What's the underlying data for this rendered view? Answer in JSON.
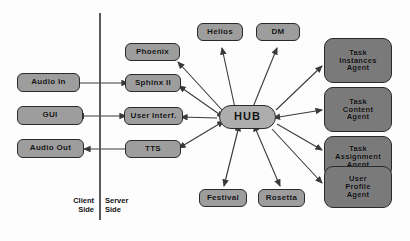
{
  "diagram": {
    "colors": {
      "node_fill": "#9d9d9d",
      "agent_fill": "#7a7a7a",
      "hub_fill": "#adadad",
      "stroke": "#2a2a2a",
      "edge": "#3a3a3a",
      "background": "#fdfdfd"
    },
    "divider": {
      "label_client": "Client\nSide",
      "label_server": "Server\nSide",
      "client_line1": "Client",
      "client_line2": "Side",
      "server_line1": "Server",
      "server_line2": "Side"
    },
    "nodes": {
      "audio_in": "Audio In",
      "gui": "GUI",
      "audio_out": "Audio Out",
      "phoenix": "Phoenix",
      "sphinx": "Sphinx II",
      "user_interf": "User Interf.",
      "tts": "TTS",
      "helios": "Helios",
      "dm": "DM",
      "hub": "HUB",
      "festival": "Festival",
      "rosetta": "Rosetta",
      "task_instances_l1": "Task",
      "task_instances_l2": "Instances",
      "task_instances_l3": "Agent",
      "task_content_l1": "Task",
      "task_content_l2": "Content",
      "task_content_l3": "Agent",
      "task_assignment_l1": "Task",
      "task_assignment_l2": "Assignment",
      "task_assignment_l3": "Agent",
      "user_profile_l1": "User",
      "user_profile_l2": "Profile",
      "user_profile_l3": "Agent"
    }
  }
}
